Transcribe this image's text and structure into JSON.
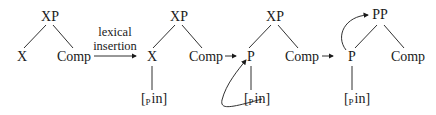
{
  "diagram": {
    "type": "syntax-tree-derivation",
    "stages": [
      {
        "root": "XP",
        "left": "X",
        "right": "Comp"
      },
      {
        "root": "XP",
        "left": "X",
        "right": "Comp",
        "lexical_item": {
          "open": "[",
          "category": "P",
          "word": "in]"
        }
      },
      {
        "root": "XP",
        "left": "P",
        "right": "Comp",
        "lexical_item": {
          "open": "[",
          "category": "P",
          "word": "in]"
        },
        "curved_arrow": "from lexical item to head P"
      },
      {
        "root": "PP",
        "left": "P",
        "right": "Comp",
        "lexical_item": {
          "open": "[",
          "category": "P",
          "word": "in]"
        },
        "curved_arrow": "from head P to root PP"
      }
    ],
    "transitions": [
      {
        "label_line1": "lexical",
        "label_line2": "insertion",
        "symbol": "→"
      },
      {
        "symbol": "→"
      },
      {
        "symbol": "→"
      }
    ],
    "colors": {
      "ink": "#1a1a1a",
      "background": "#ffffff"
    }
  }
}
